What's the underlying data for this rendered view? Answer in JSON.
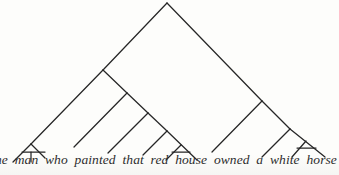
{
  "figure": {
    "kind": "syntax-tree-diagram",
    "caption_sentence": "the man who painted that red house owned a white horse",
    "line_color": "#262626",
    "background_color": "#fdfdfb",
    "text_color": "#2b2b2b"
  },
  "sentence": {
    "words": [
      "he",
      "man",
      "who",
      "painted",
      "that",
      "red",
      "house",
      "owned",
      "a",
      "white",
      "horse"
    ],
    "note_first_word_clipped": "the"
  },
  "tree": {
    "root": {
      "x": 167,
      "y": 3
    },
    "edges": [
      {
        "name": "root-left-spine",
        "x1": 167,
        "y1": 3,
        "x2": 103,
        "y2": 70
      },
      {
        "name": "root-right-spine",
        "x1": 167,
        "y1": 3,
        "x2": 262,
        "y2": 101
      },
      {
        "name": "np-subj-left",
        "x1": 103,
        "y1": 70,
        "x2": 31,
        "y2": 144
      },
      {
        "name": "np-subj-right",
        "x1": 103,
        "y1": 70,
        "x2": 127,
        "y2": 93
      },
      {
        "name": "det-n-apex-left",
        "x1": 31,
        "y1": 144,
        "x2": 13,
        "y2": 162
      },
      {
        "name": "det-n-bar",
        "x1": 31,
        "y1": 144,
        "x2": 45,
        "y2": 158
      },
      {
        "name": "det-n-stem",
        "x1": 31,
        "y1": 152,
        "x2": 31,
        "y2": 162
      },
      {
        "name": "det-n-stem-bar",
        "x1": 22,
        "y1": 152,
        "x2": 45,
        "y2": 152
      },
      {
        "name": "rel-clause-left",
        "x1": 127,
        "y1": 93,
        "x2": 74,
        "y2": 147
      },
      {
        "name": "rel-clause-right",
        "x1": 127,
        "y1": 93,
        "x2": 148,
        "y2": 113
      },
      {
        "name": "vp-rel-left",
        "x1": 148,
        "y1": 113,
        "x2": 108,
        "y2": 153
      },
      {
        "name": "vp-rel-right",
        "x1": 148,
        "y1": 113,
        "x2": 167,
        "y2": 131
      },
      {
        "name": "np-obj-left",
        "x1": 167,
        "y1": 131,
        "x2": 143,
        "y2": 155
      },
      {
        "name": "np-obj-right",
        "x1": 167,
        "y1": 131,
        "x2": 197,
        "y2": 160
      },
      {
        "name": "np-obj-inner-apex-l",
        "x1": 181,
        "y1": 145,
        "x2": 166,
        "y2": 160
      },
      {
        "name": "np-obj-inner-bar",
        "x1": 172,
        "y1": 152,
        "x2": 190,
        "y2": 152
      },
      {
        "name": "vp-main-left",
        "x1": 262,
        "y1": 101,
        "x2": 212,
        "y2": 152
      },
      {
        "name": "vp-main-right",
        "x1": 262,
        "y1": 101,
        "x2": 290,
        "y2": 129
      },
      {
        "name": "np-obj2-left",
        "x1": 290,
        "y1": 129,
        "x2": 262,
        "y2": 157
      },
      {
        "name": "np-obj2-right",
        "x1": 290,
        "y1": 129,
        "x2": 325,
        "y2": 157
      },
      {
        "name": "np-obj2-inner-apex-l",
        "x1": 306,
        "y1": 141,
        "x2": 292,
        "y2": 157
      },
      {
        "name": "np-obj2-inner-bar",
        "x1": 297,
        "y1": 148,
        "x2": 316,
        "y2": 148
      }
    ]
  }
}
